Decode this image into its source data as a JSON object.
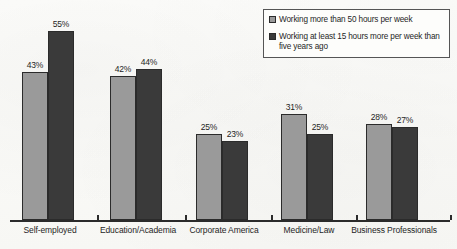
{
  "chart_data": {
    "type": "bar",
    "title": "",
    "xlabel": "",
    "ylabel": "",
    "ylim": [
      0,
      60
    ],
    "grid": false,
    "legend_position": "top-right",
    "categories": [
      "Self-employed",
      "Education/Academia",
      "Corporate America",
      "Medicine/Law",
      "Business Professionals"
    ],
    "series": [
      {
        "name": "Working more than 50 hours per week",
        "color": "#9a9a9a",
        "values": [
          43,
          42,
          25,
          31,
          28
        ],
        "labels": [
          "43%",
          "42%",
          "25%",
          "31%",
          "28%"
        ]
      },
      {
        "name": "Working at least 15 hours more per week than five years ago",
        "color": "#3a3a3a",
        "values": [
          55,
          44,
          23,
          25,
          27
        ],
        "labels": [
          "55%",
          "44%",
          "23%",
          "25%",
          "27%"
        ]
      }
    ]
  },
  "legend": {
    "items": [
      {
        "swatch_color": "#9a9a9a",
        "label": "Working more than 50 hours per week"
      },
      {
        "swatch_color": "#3a3a3a",
        "label": "Working at least 15 hours more per week than five years ago"
      }
    ]
  }
}
